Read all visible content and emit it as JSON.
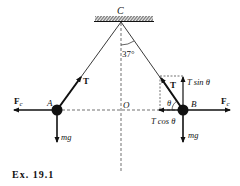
{
  "diagram": {
    "caption": "Ex. 19.1",
    "points": {
      "C": "C",
      "A": "A",
      "B": "B",
      "O": "O"
    },
    "angle_label": "37°",
    "theta": "θ",
    "forces": {
      "tension": "T",
      "centrifugal": "F",
      "centrifugal_sub": "c",
      "weight": "mg",
      "t_sin": "T sin θ",
      "t_cos": "T cos θ"
    },
    "colors": {
      "ink": "#111111",
      "background": "#ffffff"
    }
  }
}
